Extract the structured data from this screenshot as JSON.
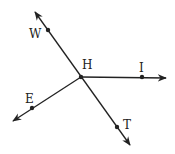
{
  "diagram": {
    "type": "geometry-rays",
    "center_point": {
      "label": "H",
      "x": 81,
      "y": 77
    },
    "lines": [
      {
        "id": "line-WT",
        "description": "line through W, H, T",
        "from": [
          35,
          12
        ],
        "to": [
          130,
          145
        ],
        "arrows": "both"
      },
      {
        "id": "ray-HI",
        "description": "ray from H through I",
        "from": [
          81,
          77
        ],
        "to": [
          166,
          78
        ],
        "arrows": "end"
      },
      {
        "id": "ray-HE",
        "description": "ray from H through E",
        "from": [
          81,
          77
        ],
        "to": [
          13,
          121
        ],
        "arrows": "end"
      }
    ],
    "points": [
      {
        "label": "H",
        "x": 81,
        "y": 77,
        "label_x": 82,
        "label_y": 59
      },
      {
        "label": "W",
        "x": 48,
        "y": 30,
        "label_x": 29,
        "label_y": 28
      },
      {
        "label": "I",
        "x": 142,
        "y": 77,
        "label_x": 138,
        "label_y": 63
      },
      {
        "label": "E",
        "x": 32,
        "y": 108,
        "label_x": 25,
        "label_y": 93
      },
      {
        "label": "T",
        "x": 117,
        "y": 127,
        "label_x": 123,
        "label_y": 119
      }
    ],
    "stroke_color": "#222222"
  }
}
